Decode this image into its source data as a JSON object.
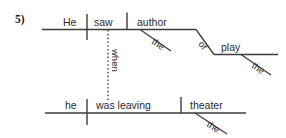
{
  "page": {
    "item_number": "5)",
    "background_color": "#ffffff",
    "ink_color": "#3c3c3c"
  },
  "diagram": {
    "type": "reed-kellogg-sentence-diagram",
    "main_clause": {
      "subject": "He",
      "verb": "saw",
      "direct_object": "author",
      "object_modifier": "the",
      "prepositional_phrase": {
        "preposition": "of",
        "object": "play",
        "object_modifier": "the"
      }
    },
    "subordinate_clause": {
      "connector": "when",
      "subject": "he",
      "verb": "was leaving",
      "direct_object": "theater",
      "object_modifier": "the"
    }
  },
  "labels": {
    "he_upper": "He",
    "saw": "saw",
    "author": "author",
    "the_author": "the",
    "of": "of",
    "play": "play",
    "the_play": "the",
    "when": "when",
    "he_lower": "he",
    "was_leaving": "was leaving",
    "theater": "theater",
    "the_theater": "the"
  }
}
